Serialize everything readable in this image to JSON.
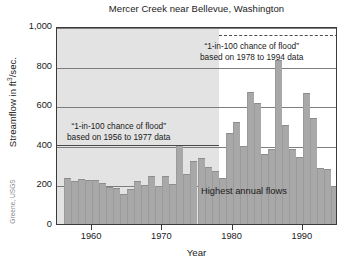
{
  "chart_data": {
    "type": "bar",
    "title": "Mercer Creek near Bellevue, Washington",
    "xlabel": "Year",
    "ylabel": "Streamflow in ft3/sec.",
    "ylabel_base": "Streamflow in ft",
    "ylabel_exp": "3",
    "ylabel_tail": "/sec.",
    "xlim": [
      1955,
      1995
    ],
    "ylim": [
      0,
      1000
    ],
    "grid": true,
    "legend": "none",
    "ytick_labels": [
      "0",
      "200",
      "400",
      "600",
      "800",
      "1,000"
    ],
    "ytick_values": [
      0,
      200,
      400,
      600,
      800,
      1000
    ],
    "xtick_labels": [
      "1960",
      "1970",
      "1980",
      "1990"
    ],
    "xtick_values": [
      1960,
      1970,
      1980,
      1990
    ],
    "series_name": "Highest annual flows",
    "x": [
      1956,
      1957,
      1958,
      1959,
      1960,
      1961,
      1962,
      1963,
      1964,
      1965,
      1966,
      1967,
      1968,
      1969,
      1970,
      1971,
      1972,
      1973,
      1974,
      1975,
      1976,
      1977,
      1978,
      1979,
      1980,
      1981,
      1982,
      1983,
      1984,
      1985,
      1986,
      1987,
      1988,
      1989,
      1990,
      1991,
      1992,
      1993,
      1994
    ],
    "values": [
      230,
      215,
      228,
      222,
      221,
      206,
      186,
      181,
      152,
      177,
      216,
      197,
      242,
      192,
      244,
      200,
      400,
      251,
      318,
      332,
      290,
      268,
      232,
      460,
      515,
      395,
      665,
      612,
      354,
      380,
      830,
      500,
      378,
      340,
      663,
      533,
      285,
      276,
      190
    ],
    "annotations": [
      {
        "id": "old-record",
        "line1": "“1-in-100 chance of flood”",
        "line2": "based on 1956 to 1977 data",
        "reference_level": 410,
        "span_years": [
          1956,
          1977
        ]
      },
      {
        "id": "new-record",
        "line1": "“1-in-100 chance of flood”",
        "line2": "based on 1978 to 1994 data",
        "reference_level": 965,
        "span_years": [
          1978,
          1994
        ]
      }
    ],
    "inline_label": "Highest annual flows",
    "shaded_region_years": [
      1955,
      1977
    ],
    "colors": {
      "bar_fill": "#a8a8a8",
      "shade_panel": "#e3e3e3",
      "gridline": "#7d7d7d",
      "axis": "#3b3b3b",
      "text": "#1a1a1a",
      "credit": "#8a8a8a"
    }
  },
  "credit": "Greene, USGS"
}
